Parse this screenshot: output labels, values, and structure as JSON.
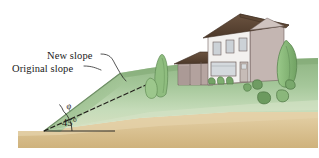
{
  "figure": {
    "labels": {
      "new_slope": "New slope",
      "original_slope": "Original slope",
      "angle_phi": "φ",
      "angle_45": "45°"
    },
    "colors": {
      "sky": "#ffffff",
      "hill_green_dark": "#7ea777",
      "hill_green_mid": "#9dbf92",
      "hill_green_pale": "#cbdcc0",
      "ground_tan": "#d9c08c",
      "ground_tan_light": "#e6d2a8",
      "roof_brown": "#5a4433",
      "wall_light": "#f2f0ee",
      "wall_mauve": "#b9a9a6",
      "wall_taupe": "#c9bcb8",
      "window_gray": "#c9cdd2",
      "shrub_green": "#6f9c63",
      "tree_green": "#84b374",
      "line_black": "#1a1a1a"
    },
    "geometry": {
      "original_slope_angle_deg": 45,
      "new_slope_angle_deg": 25,
      "slope_vertex": [
        44,
        131
      ],
      "baseline_y": 131
    },
    "elements": [
      {
        "name": "house",
        "stories": 2,
        "upper_windows": 3,
        "garage_bays": 2,
        "door": 1,
        "picture_window": 1
      },
      {
        "name": "foundation-shrubs",
        "count": 3
      },
      {
        "name": "lawn-bushes",
        "count": 5
      },
      {
        "name": "conifer-shrub",
        "count": 1
      },
      {
        "name": "round-shrub",
        "count": 1
      },
      {
        "name": "right-tree",
        "count": 1
      }
    ]
  }
}
